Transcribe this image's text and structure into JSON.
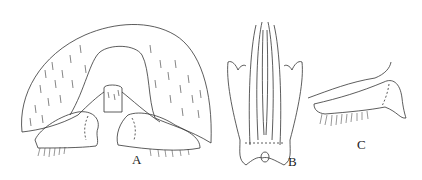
{
  "figure": {
    "panels": [
      {
        "id": "A",
        "label": "A",
        "description": "dorsal view, hairy arched tergite with paired lobes"
      },
      {
        "id": "B",
        "label": "B",
        "description": "elongate genital structure with lateral arms"
      },
      {
        "id": "C",
        "label": "C",
        "description": "lateral lobe with fringe of setae"
      }
    ],
    "colors": {
      "line": "#333333",
      "background": "#ffffff"
    }
  }
}
